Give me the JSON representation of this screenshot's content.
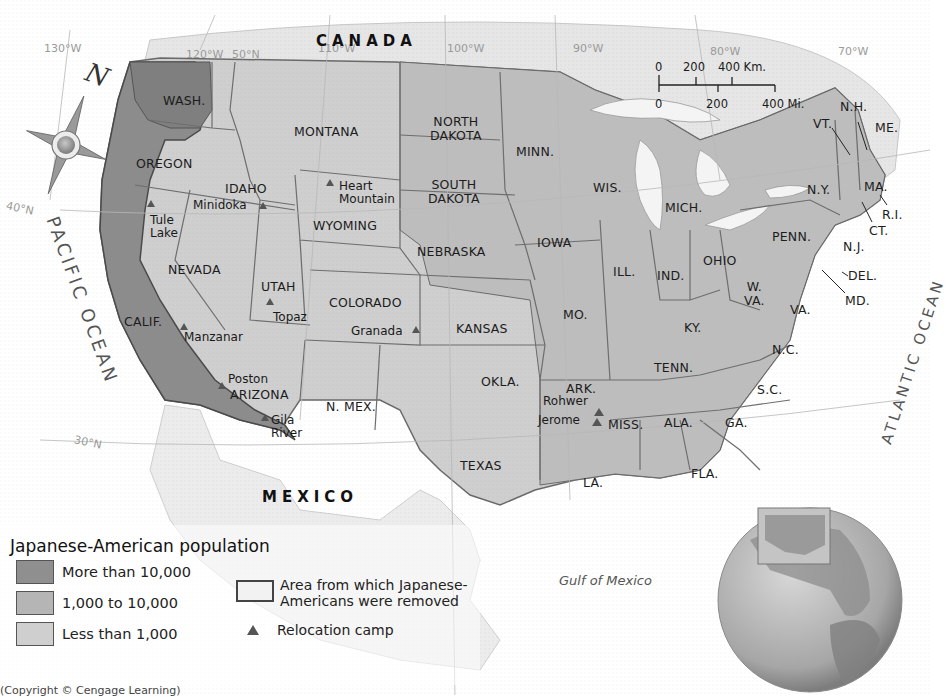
{
  "map": {
    "colors": {
      "ocean": "#ffffff",
      "high": "#8f8f8f",
      "mid": "#b5b5b5",
      "low": "#cfcfcf",
      "foreign": "#e4e4e4",
      "border": "#6a6a6a",
      "exclusion_zone": "#7a7a7a"
    },
    "countries": {
      "canada": "CANADA",
      "mexico": "MEXICO"
    },
    "water": {
      "pacific": "PACIFIC OCEAN",
      "atlantic": "ATLANTIC OCEAN",
      "gulf": "Gulf of Mexico"
    },
    "graticule": {
      "w130": "130°W",
      "w120": "120°W",
      "n50": "50°N",
      "w110": "110°W",
      "w100": "100°W",
      "w90": "90°W",
      "w80": "80°W",
      "w70": "70°W",
      "n40": "40°N",
      "n30": "30°N"
    },
    "compass": {
      "north": "N"
    },
    "scale": {
      "km_labels": [
        "0",
        "200",
        "400 Km."
      ],
      "mi_labels": [
        "0",
        "200",
        "400 Mi."
      ]
    },
    "states": {
      "wash": "WASH.",
      "oregon": "OREGON",
      "calif": "CALIF.",
      "nevada": "NEVADA",
      "idaho": "IDAHO",
      "montana": "MONTANA",
      "wyoming": "WYOMING",
      "utah": "UTAH",
      "colorado": "COLORADO",
      "arizona": "ARIZONA",
      "nmex": "N. MEX.",
      "ndakota": "NORTH\nDAKOTA",
      "sdakota": "SOUTH\nDAKOTA",
      "nebraska": "NEBRASKA",
      "kansas": "KANSAS",
      "okla": "OKLA.",
      "texas": "TEXAS",
      "minn": "MINN.",
      "iowa": "IOWA",
      "mo": "MO.",
      "ark": "ARK.",
      "la": "LA.",
      "wis": "WIS.",
      "ill": "ILL.",
      "mich": "MICH.",
      "ind": "IND.",
      "ohio": "OHIO",
      "ky": "KY.",
      "tenn": "TENN.",
      "miss": "MISS.",
      "ala": "ALA.",
      "ga": "GA.",
      "fla": "FLA.",
      "sc": "S.C.",
      "nc": "N.C.",
      "va": "VA.",
      "wva": "W.\nVA.",
      "penn": "PENN.",
      "ny": "N.Y.",
      "vt": "VT.",
      "nh": "N.H.",
      "me": "ME.",
      "ma": "MA.",
      "ri": "R.I.",
      "ct": "CT.",
      "nj": "N.J.",
      "del": "DEL.",
      "md": "MD."
    },
    "camps": {
      "tule_lake": "Tule\nLake",
      "minidoka": "Minidoka",
      "heart_mountain": "Heart\nMountain",
      "topaz": "Topaz",
      "manzanar": "Manzanar",
      "poston": "Poston",
      "gila_river": "Gila\nRiver",
      "granada": "Granada",
      "rohwer": "Rohwer",
      "jerome": "Jerome"
    }
  },
  "legend": {
    "title": "Japanese-American population",
    "items": [
      {
        "label": "More than 10,000",
        "color": "#8f8f8f"
      },
      {
        "label": "1,000 to 10,000",
        "color": "#b5b5b5"
      },
      {
        "label": "Less than 1,000",
        "color": "#cfcfcf"
      }
    ],
    "exclusion_area": "Area from which Japanese-\nAmericans were removed",
    "relocation_camp": "Relocation camp"
  },
  "credit": "(Copyright © Cengage Learning)"
}
